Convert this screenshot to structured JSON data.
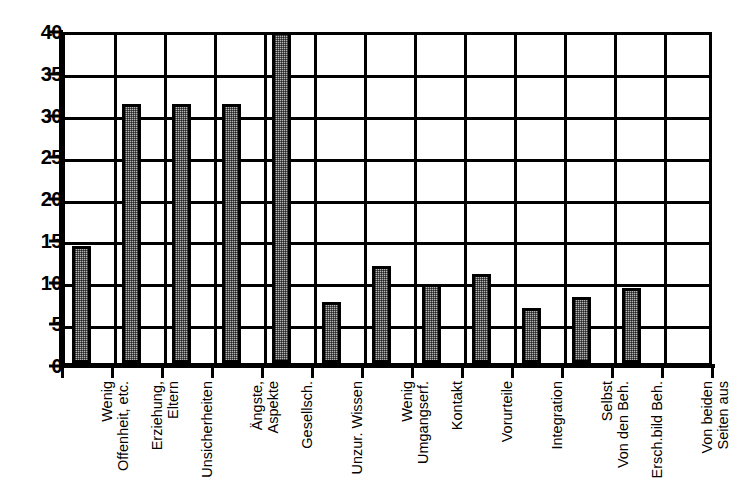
{
  "chart_data": {
    "type": "bar",
    "title": "",
    "subtitle": "",
    "xlabel": "",
    "ylabel": "",
    "ylim": [
      0,
      40
    ],
    "ytick_step": 5,
    "yticks": [
      "0",
      "5",
      "10",
      "15",
      "20",
      "25",
      "30",
      "35",
      "40"
    ],
    "grid": "horizontal",
    "legend": "none",
    "bar_color": "#b6b6b6",
    "bar_border_color": "#000000",
    "background_color": "#ffffff",
    "categories": [
      "Wenig\nOffenheit, etc.",
      "Erziehung,\nEltern",
      "Unsicherheiten",
      "Ängste,\nAspekte",
      "Gesellsch.",
      "Unzur. Wissen",
      "Wenig\nUmgangserf.",
      "Kontakt",
      "Vorurteile",
      "Integration",
      "Selbst\nVon den Beh.",
      "Ersch.bild Beh.",
      "Von beiden\nSeiten aus"
    ],
    "values": [
      14,
      31,
      31,
      31,
      40,
      7.3,
      11.6,
      9.5,
      10.7,
      6.6,
      7.9,
      9,
      0
    ],
    "bars": [
      {
        "label": "Wenig Offenheit, etc.",
        "value": 14
      },
      {
        "label": "Erziehung, Eltern",
        "value": 31
      },
      {
        "label": "Unsicherheiten",
        "value": 31
      },
      {
        "label": "Ängste, Aspekte",
        "value": 31
      },
      {
        "label": "Gesellsch.",
        "value": 40
      },
      {
        "label": "Unzur. Wissen",
        "value": 7.3
      },
      {
        "label": "Wenig Umgangserf.",
        "value": 11.6
      },
      {
        "label": "Kontakt",
        "value": 9.5
      },
      {
        "label": "Vorurteile",
        "value": 10.7
      },
      {
        "label": "Integration",
        "value": 6.6
      },
      {
        "label": "Selbst Von den Beh.",
        "value": 7.9
      },
      {
        "label": "Ersch.bild Beh.",
        "value": 9
      },
      {
        "label": "Von beiden Seiten aus",
        "value": 0
      }
    ]
  }
}
